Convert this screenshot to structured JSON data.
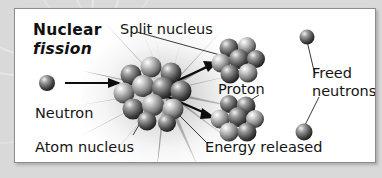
{
  "figure": {
    "title_line1": "Nuclear",
    "title_line2": "fission",
    "panel_background": "#ffffff",
    "outer_background": "#d9d9d9",
    "border_color": "#8c8c8c",
    "text_color": "#141414"
  },
  "labels": {
    "split_nucleus": "Split nucleus",
    "neutron": "Neutron",
    "atom_nucleus": "Atom nucleus",
    "proton": "Proton",
    "freed_line1": "Freed",
    "freed_line2": "neutrons",
    "energy_released": "Energy released"
  },
  "diagram": {
    "incoming_neutron": "neutron-sphere",
    "central_nucleus": "atom-nucleus-cluster",
    "fragment_top": "split-nucleus-fragment-top",
    "fragment_bottom": "split-nucleus-fragment-bottom",
    "freed_neutron_top": "freed-neutron-top",
    "freed_neutron_bottom": "freed-neutron-bottom",
    "energy_burst": "starburst-energy",
    "arrow_in": "incoming-neutron-arrow",
    "arrow_out_top": "fission-arrow-up",
    "arrow_out_bottom": "fission-arrow-down"
  }
}
